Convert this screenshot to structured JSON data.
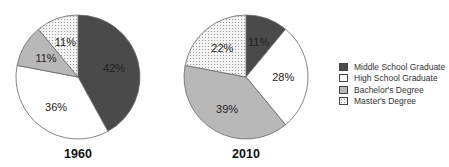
{
  "chart_data": [
    {
      "type": "pie",
      "title": "1960",
      "categories": [
        "Middle School Graduate",
        "High School Graduate",
        "Bachelor's Degree",
        "Master's Degree"
      ],
      "values": [
        42,
        36,
        11,
        11
      ],
      "labels": [
        "42%",
        "36%",
        "11%",
        "11%"
      ]
    },
    {
      "type": "pie",
      "title": "2010",
      "categories": [
        "Middle School Graduate",
        "High School Graduate",
        "Bachelor's Degree",
        "Master's Degree"
      ],
      "values": [
        11,
        28,
        39,
        22
      ],
      "labels": [
        "11%",
        "28%",
        "39%",
        "22%"
      ]
    }
  ],
  "legend": {
    "position": "right",
    "items": [
      {
        "label": "Middle School Graduate",
        "fill": "#4a4a4a"
      },
      {
        "label": "High School Graduate",
        "fill": "#ffffff"
      },
      {
        "label": "Bachelor's Degree",
        "fill": "#b8b8b8"
      },
      {
        "label": "Master's Degree",
        "fill": "dotted"
      }
    ]
  },
  "colors": {
    "middle": "#4a4a4a",
    "high": "#ffffff",
    "bachelor": "#b8b8b8",
    "master_bg": "#f2f2f2",
    "master_dot": "#9a9a9a",
    "stroke": "#666666"
  }
}
